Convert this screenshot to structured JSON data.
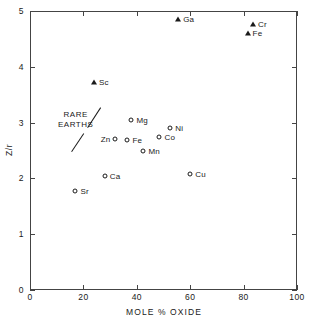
{
  "chart_data": {
    "type": "scatter",
    "title": "",
    "xlabel": "MOLE % OXIDE",
    "ylabel": "Z/r",
    "xlim": [
      0,
      100
    ],
    "ylim": [
      0,
      5
    ],
    "xticks": [
      "0",
      "20",
      "40",
      "60",
      "80",
      "100"
    ],
    "xtick_values": [
      0,
      20,
      40,
      60,
      80,
      100
    ],
    "yticks": [
      "0",
      "1",
      "2",
      "3",
      "4",
      "5"
    ],
    "ytick_values": [
      0,
      1,
      2,
      3,
      4,
      5
    ],
    "grid": false,
    "legend": "none",
    "ticks_all_sides": true,
    "series": [
      {
        "name": "triangle markers",
        "marker": "triangle",
        "points": [
          {
            "label": "Ga",
            "x": 55.5,
            "y": 4.85,
            "label_side": "right"
          },
          {
            "label": "Cr",
            "x": 83.5,
            "y": 4.76,
            "label_side": "right"
          },
          {
            "label": "Fe",
            "x": 81.5,
            "y": 4.61,
            "label_side": "right"
          },
          {
            "label": "Sc",
            "x": 24.0,
            "y": 3.72,
            "label_side": "right"
          }
        ]
      },
      {
        "name": "circle markers",
        "marker": "circle",
        "points": [
          {
            "label": "Mg",
            "x": 38.0,
            "y": 3.05,
            "label_side": "right"
          },
          {
            "label": "Ni",
            "x": 52.5,
            "y": 2.9,
            "label_side": "right"
          },
          {
            "label": "Co",
            "x": 48.5,
            "y": 2.74,
            "label_side": "right"
          },
          {
            "label": "Zn",
            "x": 32.0,
            "y": 2.7,
            "label_side": "left"
          },
          {
            "label": "Fe",
            "x": 36.5,
            "y": 2.68,
            "label_side": "right"
          },
          {
            "label": "Mn",
            "x": 42.5,
            "y": 2.5,
            "label_side": "right"
          },
          {
            "label": "Cu",
            "x": 60.0,
            "y": 2.07,
            "label_side": "right"
          },
          {
            "label": "Ca",
            "x": 28.0,
            "y": 2.05,
            "label_side": "right"
          },
          {
            "label": "Sr",
            "x": 17.0,
            "y": 1.78,
            "label_side": "right"
          }
        ]
      }
    ],
    "annotations": [
      {
        "name": "rare-earths",
        "text_line1": "RARE",
        "text_line2": "EARTHS",
        "x": 26.0,
        "y": 2.75,
        "has_dashed_divider": true
      }
    ]
  },
  "colors": {
    "axis": "#444444",
    "marker": "#1a1a1a",
    "text": "#1a1a1a",
    "background": "#ffffff"
  }
}
